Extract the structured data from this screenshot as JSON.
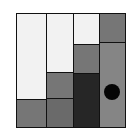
{
  "game": {
    "type": "sliding-block-puzzle",
    "board": {
      "columns": 4,
      "blocks": [
        {
          "id": "c1-top",
          "col": 1,
          "shade": "white",
          "color": "#f2f2f2"
        },
        {
          "id": "c1-bottom",
          "col": 1,
          "shade": "gray",
          "color": "#767676"
        },
        {
          "id": "c2-top",
          "col": 2,
          "shade": "white",
          "color": "#f2f2f2"
        },
        {
          "id": "c2-mid",
          "col": 2,
          "shade": "gray",
          "color": "#767676"
        },
        {
          "id": "c2-bottom",
          "col": 2,
          "shade": "textured-gray",
          "color": "#6a6a6a"
        },
        {
          "id": "c3-top",
          "col": 3,
          "shade": "white",
          "color": "#f2f2f2"
        },
        {
          "id": "c3-mid",
          "col": 3,
          "shade": "gray",
          "color": "#767676"
        },
        {
          "id": "c3-bottom",
          "col": 3,
          "shade": "textured-dark",
          "color": "#262626"
        },
        {
          "id": "c4-top",
          "col": 4,
          "shade": "gray",
          "color": "#767676"
        },
        {
          "id": "c4-bottom",
          "col": 4,
          "shade": "textured-light",
          "color": "#858585"
        }
      ],
      "piece": {
        "name": "black-circle",
        "color": "#050505",
        "in_block": "c4-bottom"
      }
    },
    "colors": {
      "border": "#111111",
      "background": "#ffffff"
    }
  }
}
